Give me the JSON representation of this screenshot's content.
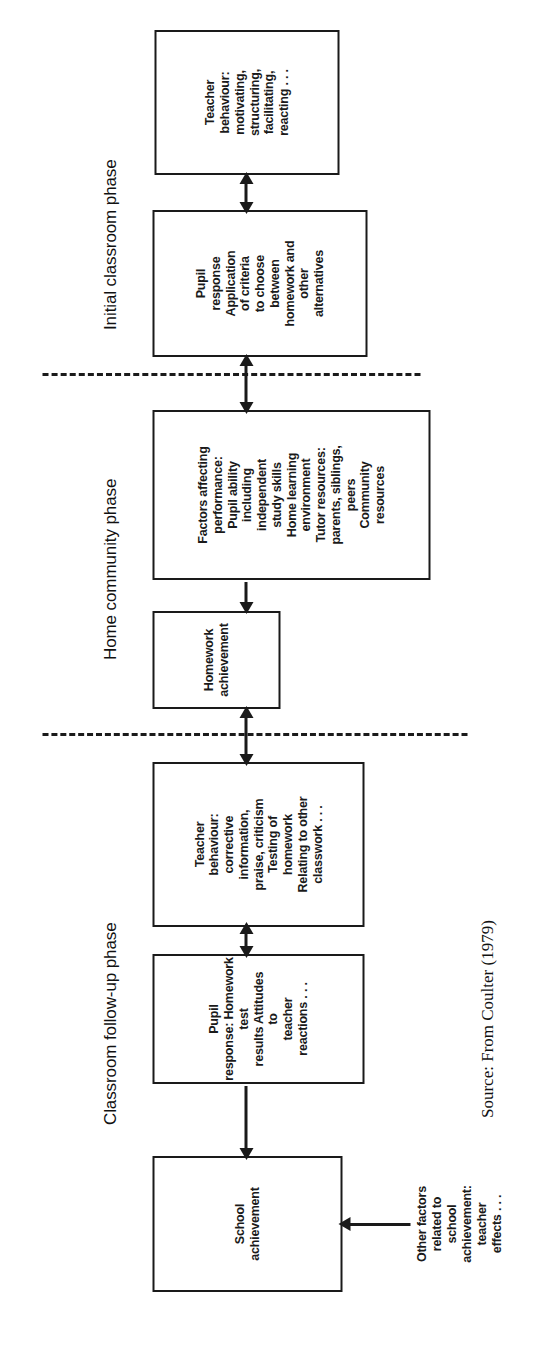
{
  "figure": {
    "source_caption": "Source: From Coulter (1979)",
    "ink_color": "#1a1a1a",
    "background_color": "#ffffff"
  },
  "phases": [
    {
      "id": "initial-classroom",
      "label": "Initial classroom phase"
    },
    {
      "id": "home-community",
      "label": "Home community phase"
    },
    {
      "id": "classroom-followup",
      "label": "Classroom follow-up phase"
    }
  ],
  "nodes": [
    {
      "id": "teacher-behaviour-initial",
      "phase": "initial-classroom",
      "text": "Teacher\nbehaviour:\nmotivating,\nstructuring,\nfacilitating,\nreacting . . ."
    },
    {
      "id": "pupil-response-initial",
      "phase": "initial-classroom",
      "text": "Pupil\nresponse\nApplication\nof criteria\nto choose\nbetween\nhomework and\nother\nalternatives"
    },
    {
      "id": "factors-affecting-performance",
      "phase": "home-community",
      "text": "Factors affecting\nperformance:\nPupil ability\nincluding\nindependent\nstudy skills\nHome learning\nenvironment\nTutor resources:\nparents, siblings,\npeers\nCommunity\nresources"
    },
    {
      "id": "homework-achievement",
      "phase": "home-community",
      "text": "Homework\nachievement"
    },
    {
      "id": "teacher-behaviour-followup",
      "phase": "classroom-followup",
      "text": "Teacher\nbehaviour:\ncorrective\ninformation,\npraise, criticism\nTesting of\nhomework\nRelating to other\nclasswork . . ."
    },
    {
      "id": "pupil-response-followup",
      "phase": "classroom-followup",
      "text": "Pupil\nresponse: Homework\ntest\nresults Attitudes\nto\nteacher\nreactions . . ."
    },
    {
      "id": "school-achievement",
      "phase": "classroom-followup",
      "text": "School\nachievement"
    }
  ],
  "annotations": [
    {
      "id": "other-factors",
      "text": "Other factors\nrelated to\nschool\nachievement:\nteacher\neffects . . ."
    }
  ],
  "connectors": [
    {
      "id": "teacher-initial-to-pupil-initial",
      "kind": "double-arrow"
    },
    {
      "id": "pupil-initial-to-factors",
      "kind": "double-arrow"
    },
    {
      "id": "factors-to-homework-achievement",
      "kind": "single-arrow"
    },
    {
      "id": "homework-achievement-to-teacher-followup",
      "kind": "double-arrow"
    },
    {
      "id": "teacher-followup-to-pupil-followup",
      "kind": "double-arrow"
    },
    {
      "id": "pupil-followup-to-school-achievement",
      "kind": "single-arrow"
    },
    {
      "id": "other-factors-to-school-achievement",
      "kind": "single-arrow"
    }
  ]
}
